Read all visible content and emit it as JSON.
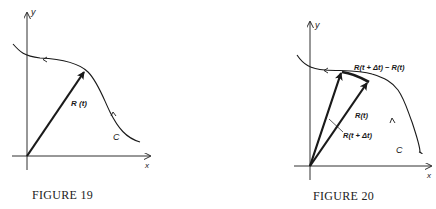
{
  "figures": [
    {
      "caption": "FIGURE 19",
      "axis_x_label": "x",
      "axis_y_label": "y",
      "vector_label": "R (t)",
      "curve_label": "C"
    },
    {
      "caption": "FIGURE 20",
      "axis_x_label": "x",
      "axis_y_label": "y",
      "vector1_label": "R(t)",
      "vector2_label": "R(t + Δt)",
      "difference_label": "R(t + Δt) − R(t)",
      "curve_label": "C"
    }
  ],
  "colors": {
    "ink": "#1a1a1a",
    "background": "#ffffff"
  }
}
